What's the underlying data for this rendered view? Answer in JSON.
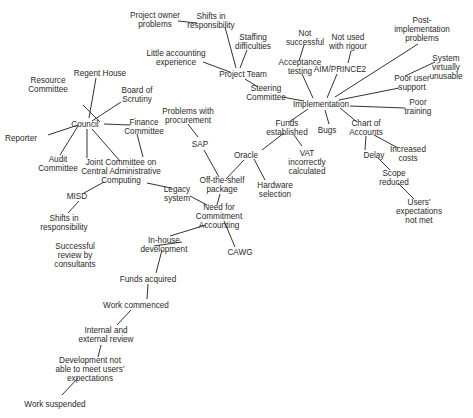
{
  "diagram": {
    "type": "concept-map",
    "nodes": [
      {
        "id": "project_owner_problems",
        "label": "Project owner\nproblems",
        "x": 155,
        "y": 20
      },
      {
        "id": "shifts_resp_top",
        "label": "Shifts in\nresponsibility",
        "x": 211,
        "y": 21
      },
      {
        "id": "staffing_difficulties",
        "label": "Staffing\ndifficulties",
        "x": 253,
        "y": 42
      },
      {
        "id": "little_accounting",
        "label": "Little accounting\nexperience",
        "x": 176,
        "y": 58
      },
      {
        "id": "project_team",
        "label": "Project Team",
        "x": 243,
        "y": 74
      },
      {
        "id": "not_successful",
        "label": "Not\nsuccessful",
        "x": 305,
        "y": 38
      },
      {
        "id": "not_used_rigour",
        "label": "Not used\nwith rigour",
        "x": 348,
        "y": 42
      },
      {
        "id": "post_impl",
        "label": "Post-\nimplementation\nproblems",
        "x": 422,
        "y": 29
      },
      {
        "id": "acceptance_testing",
        "label": "Acceptance\ntesting",
        "x": 300,
        "y": 67
      },
      {
        "id": "aim_prince2",
        "label": "AIM/PRINCE2",
        "x": 340,
        "y": 69
      },
      {
        "id": "system_unusable",
        "label": "System\nvirtually\nunusable",
        "x": 446,
        "y": 67
      },
      {
        "id": "steering_committee",
        "label": "Steering\nCommittee",
        "x": 266,
        "y": 93
      },
      {
        "id": "poor_user_support",
        "label": "Poor user\nsupport",
        "x": 412,
        "y": 83
      },
      {
        "id": "implementation",
        "label": "Implementation",
        "x": 321,
        "y": 104
      },
      {
        "id": "poor_training",
        "label": "Poor\ntraining",
        "x": 418,
        "y": 107
      },
      {
        "id": "funds_established",
        "label": "Funds\nestablished",
        "x": 287,
        "y": 128
      },
      {
        "id": "bugs",
        "label": "Bugs",
        "x": 327,
        "y": 130
      },
      {
        "id": "chart_of_accounts",
        "label": "Chart of\nAccounts",
        "x": 366,
        "y": 128
      },
      {
        "id": "regent_house",
        "label": "Regent House",
        "x": 100,
        "y": 73
      },
      {
        "id": "resource_committee",
        "label": "Resource\nCommittee",
        "x": 48,
        "y": 85
      },
      {
        "id": "board_scrutiny",
        "label": "Board of\nScrutiny",
        "x": 137,
        "y": 95
      },
      {
        "id": "problems_procurement",
        "label": "Problems with\nprocurement",
        "x": 188,
        "y": 116
      },
      {
        "id": "council",
        "label": "Council",
        "x": 85,
        "y": 124
      },
      {
        "id": "finance_committee",
        "label": "Finance\nCommittee",
        "x": 144,
        "y": 127
      },
      {
        "id": "reporter",
        "label": "Reporter",
        "x": 21,
        "y": 138
      },
      {
        "id": "oracle",
        "label": "Oracle",
        "x": 246,
        "y": 155
      },
      {
        "id": "vat",
        "label": "VAT\nincorrectly\ncalculated",
        "x": 307,
        "y": 162
      },
      {
        "id": "delay",
        "label": "Delay",
        "x": 374,
        "y": 155
      },
      {
        "id": "increased_costs",
        "label": "Increased\ncosts",
        "x": 408,
        "y": 154
      },
      {
        "id": "sap",
        "label": "SAP",
        "x": 200,
        "y": 144
      },
      {
        "id": "audit_committee",
        "label": "Audit\nCommittee",
        "x": 58,
        "y": 164
      },
      {
        "id": "joint_committee",
        "label": "Joint Committee on\nCentral Administrative\nComputing",
        "x": 121,
        "y": 171
      },
      {
        "id": "scope_reduced",
        "label": "Scope\nreduced",
        "x": 394,
        "y": 178
      },
      {
        "id": "off_the_shelf",
        "label": "Off-the-shelf\npackage",
        "x": 222,
        "y": 185
      },
      {
        "id": "hardware_selection",
        "label": "Hardware\nselection",
        "x": 275,
        "y": 190
      },
      {
        "id": "legacy_system",
        "label": "Legacy\nsystem",
        "x": 177,
        "y": 194
      },
      {
        "id": "misd",
        "label": "MISD",
        "x": 77,
        "y": 196
      },
      {
        "id": "users_expectations",
        "label": "Users'\nexpectations\nnot met",
        "x": 419,
        "y": 211
      },
      {
        "id": "need_commitment",
        "label": "Need for\nCommitment\nAccounting",
        "x": 219,
        "y": 216
      },
      {
        "id": "shifts_resp_bottom",
        "label": "Shifts in\nresponsibility",
        "x": 64,
        "y": 223
      },
      {
        "id": "in_house",
        "label": "In-house\ndevelopment",
        "x": 164,
        "y": 245
      },
      {
        "id": "cawg",
        "label": "CAWG",
        "x": 240,
        "y": 252
      },
      {
        "id": "successful_review",
        "label": "Successful\nreview by\nconsultants",
        "x": 75,
        "y": 255
      },
      {
        "id": "funds_acquired",
        "label": "Funds acquired",
        "x": 148,
        "y": 279
      },
      {
        "id": "work_commenced",
        "label": "Work commenced",
        "x": 136,
        "y": 305
      },
      {
        "id": "internal_external",
        "label": "Internal and\nexternal review",
        "x": 106,
        "y": 335
      },
      {
        "id": "dev_not_able",
        "label": "Development not\nable to meet users'\nexpectations",
        "x": 90,
        "y": 369
      },
      {
        "id": "work_suspended",
        "label": "Work suspended",
        "x": 55,
        "y": 404
      }
    ],
    "edges": [
      [
        178,
        21,
        197,
        23
      ],
      [
        225,
        27,
        236,
        68
      ],
      [
        247,
        50,
        240,
        68
      ],
      [
        203,
        62,
        230,
        72
      ],
      [
        245,
        79,
        258,
        87
      ],
      [
        282,
        97,
        304,
        101
      ],
      [
        304,
        45,
        299,
        61
      ],
      [
        302,
        74,
        313,
        98
      ],
      [
        351,
        51,
        348,
        63
      ],
      [
        337,
        74,
        327,
        98
      ],
      [
        418,
        44,
        335,
        97
      ],
      [
        435,
        62,
        405,
        76
      ],
      [
        399,
        88,
        339,
        100
      ],
      [
        350,
        106,
        405,
        108
      ],
      [
        340,
        108,
        357,
        122
      ],
      [
        308,
        109,
        289,
        122
      ],
      [
        325,
        110,
        329,
        124
      ],
      [
        284,
        133,
        262,
        150
      ],
      [
        294,
        135,
        302,
        146
      ],
      [
        254,
        159,
        265,
        180
      ],
      [
        244,
        160,
        226,
        179
      ],
      [
        188,
        124,
        198,
        137
      ],
      [
        204,
        150,
        219,
        177
      ],
      [
        220,
        194,
        217,
        205
      ],
      [
        190,
        196,
        207,
        205
      ],
      [
        171,
        188,
        147,
        183
      ],
      [
        224,
        221,
        235,
        247
      ],
      [
        206,
        225,
        170,
        236
      ],
      [
        182,
        242,
        154,
        246
      ],
      [
        162,
        250,
        156,
        273
      ],
      [
        148,
        284,
        147,
        299
      ],
      [
        131,
        310,
        117,
        325
      ],
      [
        101,
        345,
        98,
        357
      ],
      [
        78,
        378,
        62,
        395
      ],
      [
        100,
        122,
        83,
        105
      ],
      [
        89,
        118,
        96,
        78
      ],
      [
        92,
        121,
        121,
        102
      ],
      [
        104,
        124,
        130,
        125
      ],
      [
        78,
        125,
        48,
        135
      ],
      [
        78,
        126,
        60,
        155
      ],
      [
        87,
        129,
        87,
        158
      ],
      [
        92,
        129,
        120,
        161
      ],
      [
        137,
        134,
        143,
        157
      ],
      [
        104,
        182,
        84,
        193
      ],
      [
        79,
        201,
        68,
        213
      ],
      [
        366,
        136,
        365,
        150
      ],
      [
        374,
        135,
        398,
        148
      ],
      [
        378,
        158,
        390,
        170
      ],
      [
        398,
        183,
        414,
        199
      ]
    ]
  },
  "chart_data": {
    "type": "table",
    "root": "Need for Commitment Accounting"
  }
}
